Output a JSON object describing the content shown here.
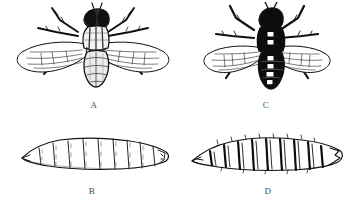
{
  "plate": {
    "title": "Comparative plate of two fly species: adults and larvae",
    "background_color": "#ffffff",
    "ink_color": "#111111",
    "label_color": "#4a4a4a",
    "width": 360,
    "height": 205,
    "layout": "2 columns x 2 rows"
  },
  "figures": [
    {
      "id": "A",
      "label": "A",
      "kind": "adult-fly",
      "position": "top-left",
      "description": "Adult fly, dorsal view, pale/hatched rendering",
      "body_shading": "light, line-hatched abdomen with striped thorax",
      "wing_style": "broad, transparent, venation visible",
      "abdomen_markings": "none (pale, checkered hatching)",
      "leg_count": 6,
      "wing_count": 2
    },
    {
      "id": "C",
      "label": "C",
      "kind": "adult-fly",
      "position": "top-right",
      "description": "Adult fly, dorsal view, solid black rendering with pale spots",
      "body_shading": "solid black thorax and abdomen",
      "wing_style": "narrower, transparent, venation visible",
      "abdomen_markings": "paired pale spots in a central column",
      "spot_rows": 5,
      "leg_count": 6,
      "wing_count": 2
    },
    {
      "id": "B",
      "label": "B",
      "kind": "larva",
      "position": "bottom-left",
      "description": "Fly larva (maggot), lateral view, lightly outlined",
      "segment_count": 11,
      "segment_style": "thin outlined segment divisions",
      "head_end": "left, tapered to a point",
      "tail_end": "right, blunt with spiracular plate"
    },
    {
      "id": "D",
      "label": "D",
      "kind": "larva",
      "position": "bottom-right",
      "description": "Fly larva (maggot), lateral view, heavy dark segment bands",
      "segment_count": 11,
      "segment_style": "bold black vertical bands at segment boundaries",
      "head_end": "left, tapered to a point",
      "tail_end": "right, blunt and notched"
    }
  ],
  "labels": {
    "a": "A",
    "b": "B",
    "c": "C",
    "d": "D"
  }
}
